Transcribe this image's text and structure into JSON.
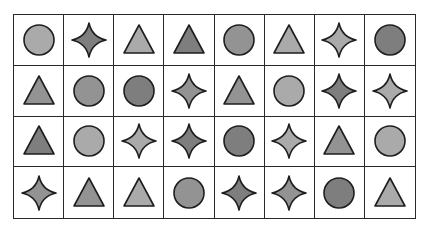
{
  "grid": {
    "rows": 4,
    "cols": 8,
    "colors": {
      "light": "#aaaaaa",
      "medium": "#939393",
      "dark": "#7e7e7e",
      "stroke": "#1e1e1e"
    },
    "cells": [
      [
        {
          "shape": "circle",
          "shade": "light"
        },
        {
          "shape": "star",
          "shade": "dark"
        },
        {
          "shape": "triangle",
          "shade": "light"
        },
        {
          "shape": "triangle",
          "shade": "dark"
        },
        {
          "shape": "circle",
          "shade": "medium"
        },
        {
          "shape": "triangle",
          "shade": "light"
        },
        {
          "shape": "star",
          "shade": "light"
        },
        {
          "shape": "circle",
          "shade": "dark"
        }
      ],
      [
        {
          "shape": "triangle",
          "shade": "medium"
        },
        {
          "shape": "circle",
          "shade": "medium"
        },
        {
          "shape": "circle",
          "shade": "dark"
        },
        {
          "shape": "star",
          "shade": "medium"
        },
        {
          "shape": "triangle",
          "shade": "medium"
        },
        {
          "shape": "circle",
          "shade": "light"
        },
        {
          "shape": "star",
          "shade": "dark"
        },
        {
          "shape": "star",
          "shade": "light"
        }
      ],
      [
        {
          "shape": "triangle",
          "shade": "dark"
        },
        {
          "shape": "circle",
          "shade": "light"
        },
        {
          "shape": "star",
          "shade": "light"
        },
        {
          "shape": "star",
          "shade": "dark"
        },
        {
          "shape": "circle",
          "shade": "dark"
        },
        {
          "shape": "star",
          "shade": "light"
        },
        {
          "shape": "triangle",
          "shade": "medium"
        },
        {
          "shape": "circle",
          "shade": "light"
        }
      ],
      [
        {
          "shape": "star",
          "shade": "medium"
        },
        {
          "shape": "triangle",
          "shade": "medium"
        },
        {
          "shape": "triangle",
          "shade": "light"
        },
        {
          "shape": "circle",
          "shade": "medium"
        },
        {
          "shape": "star",
          "shade": "dark"
        },
        {
          "shape": "star",
          "shade": "medium"
        },
        {
          "shape": "circle",
          "shade": "dark"
        },
        {
          "shape": "triangle",
          "shade": "light"
        }
      ]
    ]
  }
}
